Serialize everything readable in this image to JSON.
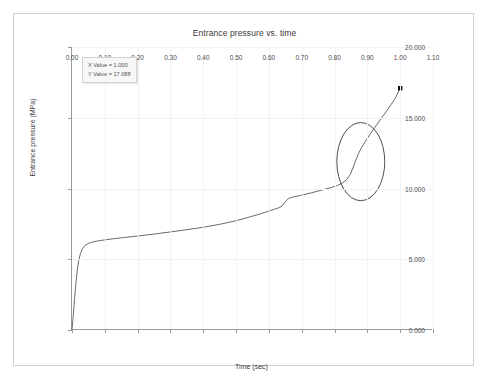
{
  "window": {
    "title": "Entrance pressure vs. time"
  },
  "tooltip": {
    "x_label": "X Value = 1.000",
    "y_label": "Y Value = 17.088"
  },
  "axes": {
    "x_title": "Time (sec)",
    "y_title": "Entrance pressure (MPa)",
    "x_ticks": [
      "0.00",
      "0.10",
      "0.20",
      "0.30",
      "0.40",
      "0.50",
      "0.60",
      "0.70",
      "0.80",
      "0.90",
      "1.00",
      "1.10"
    ],
    "y_ticks": [
      "0.000",
      "5.000",
      "10.000",
      "15.000",
      "20.000"
    ]
  },
  "colors": {
    "curve": "#595959",
    "annotation_ellipse": "#3a3a3a",
    "marker": "#101010",
    "grid": "#f2f2f2",
    "axis": "#9a9a9a",
    "frame": "#cfcfcf",
    "text": "#3a3a3a"
  },
  "chart_data": {
    "type": "line",
    "title": "Entrance pressure vs. time",
    "xlabel": "Time (sec)",
    "ylabel": "Entrance pressure (MPa)",
    "xlim": [
      0.0,
      1.1
    ],
    "ylim": [
      0.0,
      20.0
    ],
    "xticks": [
      0.0,
      0.1,
      0.2,
      0.3,
      0.4,
      0.5,
      0.6,
      0.7,
      0.8,
      0.9,
      1.0,
      1.1
    ],
    "yticks": [
      0.0,
      5.0,
      10.0,
      15.0,
      20.0
    ],
    "grid": true,
    "legend": "none",
    "series": [
      {
        "name": "Entrance pressure",
        "x": [
          0.0,
          0.004,
          0.008,
          0.012,
          0.016,
          0.02,
          0.026,
          0.032,
          0.04,
          0.05,
          0.065,
          0.08,
          0.1,
          0.13,
          0.16,
          0.2,
          0.25,
          0.3,
          0.35,
          0.4,
          0.45,
          0.5,
          0.54,
          0.57,
          0.6,
          0.62,
          0.63,
          0.64,
          0.648,
          0.655,
          0.662,
          0.67,
          0.68,
          0.7,
          0.73,
          0.76,
          0.79,
          0.81,
          0.825,
          0.838,
          0.848,
          0.856,
          0.864,
          0.872,
          0.882,
          0.895,
          0.91,
          0.93,
          0.95,
          0.97,
          0.985,
          1.0
        ],
        "y": [
          0.0,
          1.05,
          2.3,
          3.35,
          4.2,
          4.85,
          5.42,
          5.75,
          5.98,
          6.12,
          6.23,
          6.3,
          6.37,
          6.46,
          6.54,
          6.64,
          6.78,
          6.93,
          7.09,
          7.26,
          7.47,
          7.72,
          7.98,
          8.18,
          8.4,
          8.56,
          8.64,
          8.76,
          8.98,
          9.2,
          9.32,
          9.38,
          9.43,
          9.53,
          9.7,
          9.88,
          10.07,
          10.23,
          10.4,
          10.65,
          11.0,
          11.45,
          11.95,
          12.42,
          12.88,
          13.38,
          13.9,
          14.56,
          15.2,
          15.85,
          16.38,
          17.088
        ]
      }
    ],
    "annotations": [
      {
        "type": "ellipse",
        "name": "highlight-ellipse",
        "center_x": 0.88,
        "center_y": 11.9,
        "radius_x": 0.073,
        "radius_y": 2.76
      },
      {
        "type": "marker",
        "name": "endpoint-marker",
        "shape": "square",
        "x": 1.0,
        "y": 17.088
      },
      {
        "type": "datatip",
        "name": "cursor-datatip",
        "x_text": "X Value = 1.000",
        "y_text": "Y Value = 17.088"
      }
    ]
  }
}
